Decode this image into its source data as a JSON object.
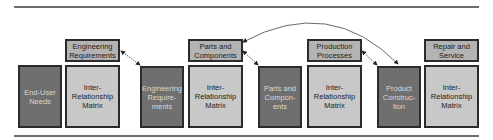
{
  "diagram": {
    "colors": {
      "dark_box": "#6f6f6f",
      "matrix_box": "#c8c8c8",
      "header_box": "#b3b3b3",
      "border": "#2b2b2b",
      "rule": "#6e6e6e"
    },
    "stages": [
      {
        "input": "End-User\nNeeds",
        "header": "Engineering\nRequirements",
        "matrix": "Inter-\nRelationship\nMatrix"
      },
      {
        "input": "Engineering\nRequire-\nments",
        "header": "Parts and\nComponents",
        "matrix": "Inter-\nRelationship\nMatrix"
      },
      {
        "input": "Parts and\nCompon-\nents",
        "header": "Production\nProcesses",
        "matrix": "Inter-\nRelationship\nMatrix"
      },
      {
        "input": "Product\nConstruc-\ntion",
        "header": "Repair and\nService",
        "matrix": "Inter-\nRelationship\nMatrix"
      }
    ],
    "arrows": [
      {
        "from": "Engineering Requirements",
        "to": "Engineering Requirements (input)",
        "type": "bidirectional"
      },
      {
        "from": "Parts and Components",
        "to": "Parts and Components (input)",
        "type": "bidirectional"
      },
      {
        "from": "Production Processes",
        "to": "Product Construction",
        "type": "bidirectional"
      },
      {
        "from": "Product Construction",
        "to": "Parts and Components",
        "type": "curved-bidirectional"
      }
    ]
  }
}
